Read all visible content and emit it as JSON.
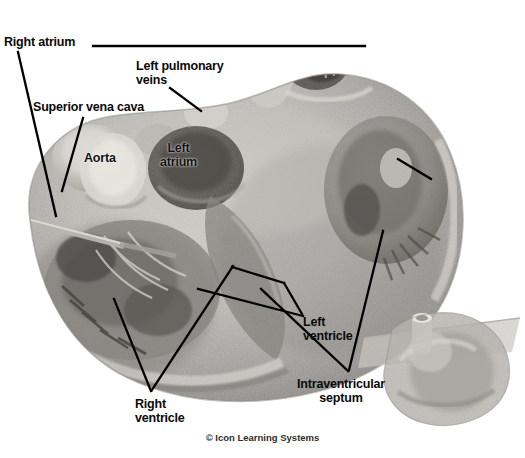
{
  "image": {
    "kind": "anatomical-illustration",
    "subject": "heart-cross-section",
    "rendering": "grayscale-photographic",
    "background_color": "#ffffff",
    "width": 525,
    "height": 458
  },
  "labels": {
    "right_atrium": "Right atrium",
    "left_pulmonary_veins": "Left pulmonary\nveins",
    "superior_vena_cava": "Superior vena cava",
    "aorta": "Aorta",
    "left_atrium": "Left\natrium",
    "left_ventricle": "Left\nventricle",
    "right_ventricle": "Right\nventricle",
    "intraventricular_septum": "Intraventricular\nseptum"
  },
  "credit": {
    "text": "© Icon Learning Systems"
  },
  "colors": {
    "label_text": "#0a0a0a",
    "leader_line": "#000000",
    "credit_text": "#2e2e2e",
    "background": "#ffffff",
    "tissue_light": "#d8d5d0",
    "tissue_mid": "#9e9b96",
    "tissue_dark": "#5c5a57",
    "chamber_shadow": "#46443f"
  },
  "leader_lines": [
    {
      "name": "right-atrium-horizontal",
      "from": [
        93,
        46
      ],
      "to": [
        365,
        46
      ]
    },
    {
      "name": "right-atrium-diagonal",
      "from": [
        18,
        52
      ],
      "to": [
        56,
        216
      ]
    },
    {
      "name": "left-pulmonary-veins",
      "from": [
        170,
        88
      ],
      "to": [
        200,
        110
      ]
    },
    {
      "name": "superior-vena-cava",
      "from": [
        82,
        118
      ],
      "to": [
        62,
        190
      ]
    },
    {
      "name": "left-ventricle",
      "from": [
        302,
        318
      ],
      "to": [
        282,
        283
      ]
    },
    {
      "name": "left-ventricle-upper",
      "from": [
        282,
        283
      ],
      "to": [
        232,
        268
      ]
    },
    {
      "name": "left-ventricle-long",
      "from": [
        302,
        318
      ],
      "to": [
        200,
        290
      ]
    },
    {
      "name": "right-ventricle",
      "from": [
        152,
        392
      ],
      "to": [
        232,
        268
      ]
    },
    {
      "name": "right-ventricle-second",
      "from": [
        152,
        392
      ],
      "to": [
        115,
        300
      ]
    },
    {
      "name": "intraventricular-septum",
      "from": [
        348,
        372
      ],
      "to": [
        382,
        232
      ]
    },
    {
      "name": "septum-crossing",
      "from": [
        348,
        372
      ],
      "to": [
        262,
        290
      ]
    },
    {
      "name": "chamber-right",
      "from": [
        430,
        178
      ],
      "to": [
        398,
        160
      ]
    }
  ],
  "inset": {
    "name": "whole-heart-orientation-inset",
    "position": [
      388,
      318
    ],
    "size": [
      130,
      112
    ],
    "description": "Whole heart with sectioning plane"
  }
}
